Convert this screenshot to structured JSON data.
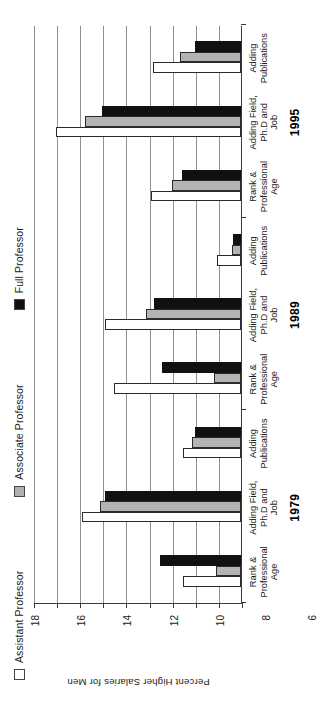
{
  "chart_data": {
    "type": "bar",
    "title": "",
    "xlabel": "",
    "ylabel": "Percent Higher Salaries for Men",
    "ylim": [
      0,
      18
    ],
    "ytick_labels": [
      "0",
      "2",
      "4",
      "6",
      "8",
      "10",
      "12",
      "14",
      "16",
      "18"
    ],
    "ytick_values": [
      0,
      2,
      4,
      6,
      8,
      10,
      12,
      14,
      16,
      18
    ],
    "grid": true,
    "legend_position": "top",
    "orientation": "rotated-90-ccw",
    "groups": [
      {
        "year": "1979",
        "categories": [
          "Rank &\nProfessional\nAge",
          "Adding Field,\nPh.D and\nJob",
          "Adding\nPublications"
        ]
      },
      {
        "year": "1989",
        "categories": [
          "Rank &\nProfessional\nAge",
          "Adding Field,\nPh.D and\nJob",
          "Adding\nPublications"
        ]
      },
      {
        "year": "1995",
        "categories": [
          "Rank &\nProfessional\nAge",
          "Adding Field,\nPh.D and\nJob",
          "Adding\nPublications"
        ]
      }
    ],
    "categories": [
      "Rank & Professional Age",
      "Adding Field, Ph.D and Job",
      "Adding Publications",
      "Rank & Professional Age",
      "Adding Field, Ph.D and Job",
      "Adding Publications",
      "Rank & Professional Age",
      "Adding Field, Ph.D and Job",
      "Adding Publications"
    ],
    "series": [
      {
        "name": "Assistant Professor",
        "color": "#ffffff",
        "values": [
          5.0,
          13.8,
          5.0,
          11.0,
          11.8,
          2.1,
          7.8,
          16.0,
          7.6
        ]
      },
      {
        "name": "Associate Professor",
        "color": "#b3b3b3",
        "values": [
          2.2,
          12.2,
          4.2,
          2.3,
          8.2,
          0.8,
          6.0,
          13.5,
          5.3
        ]
      },
      {
        "name": "Full Professor",
        "color": "#111111",
        "values": [
          7.0,
          11.8,
          4.0,
          6.8,
          7.5,
          0.7,
          5.1,
          12.0,
          4.0
        ]
      }
    ]
  },
  "legend": {
    "items": [
      {
        "label": "Assistant Professor",
        "swatch": "white-square-icon"
      },
      {
        "label": "Associate Professor",
        "swatch": "gray-square-icon"
      },
      {
        "label": "Full Professor",
        "swatch": "black-square-icon"
      }
    ]
  },
  "axis": {
    "y_title": "Percent Higher Salaries for Men"
  }
}
